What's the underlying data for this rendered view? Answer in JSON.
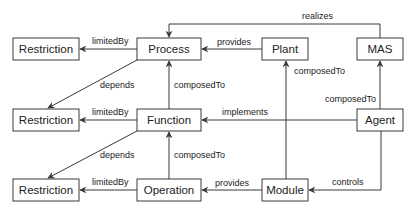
{
  "diagram": {
    "type": "ontology-relationship-graph",
    "nodes": {
      "restriction1": {
        "label": "Restriction",
        "x": 13,
        "y": 38,
        "w": 66,
        "h": 22
      },
      "process": {
        "label": "Process",
        "x": 137,
        "y": 38,
        "w": 64,
        "h": 22
      },
      "plant": {
        "label": "Plant",
        "x": 262,
        "y": 38,
        "w": 46,
        "h": 22
      },
      "mas": {
        "label": "MAS",
        "x": 357,
        "y": 38,
        "w": 46,
        "h": 22
      },
      "restriction2": {
        "label": "Restriction",
        "x": 13,
        "y": 109,
        "w": 66,
        "h": 22
      },
      "function": {
        "label": "Function",
        "x": 137,
        "y": 109,
        "w": 64,
        "h": 22
      },
      "agent": {
        "label": "Agent",
        "x": 357,
        "y": 109,
        "w": 46,
        "h": 22
      },
      "restriction3": {
        "label": "Restriction",
        "x": 13,
        "y": 179,
        "w": 66,
        "h": 22
      },
      "operation": {
        "label": "Operation",
        "x": 137,
        "y": 179,
        "w": 64,
        "h": 22
      },
      "module": {
        "label": "Module",
        "x": 262,
        "y": 179,
        "w": 46,
        "h": 22
      }
    },
    "edges": [
      {
        "from": "process",
        "to": "restriction1",
        "label": "limitedBy"
      },
      {
        "from": "plant",
        "to": "process",
        "label": "provides"
      },
      {
        "from": "mas",
        "to": "process",
        "label": "realizes"
      },
      {
        "from": "process",
        "to": "restriction2",
        "label": "depends"
      },
      {
        "from": "function",
        "to": "process",
        "label": "composedTo"
      },
      {
        "from": "module",
        "to": "plant",
        "label": "composedTo"
      },
      {
        "from": "agent",
        "to": "mas",
        "label": "composedTo"
      },
      {
        "from": "function",
        "to": "restriction2",
        "label": "limitedBy"
      },
      {
        "from": "agent",
        "to": "function",
        "label": "implements"
      },
      {
        "from": "function",
        "to": "restriction3",
        "label": "depends"
      },
      {
        "from": "operation",
        "to": "function",
        "label": "composedTo"
      },
      {
        "from": "operation",
        "to": "restriction3",
        "label": "limitedBy"
      },
      {
        "from": "module",
        "to": "operation",
        "label": "provides"
      },
      {
        "from": "agent",
        "to": "module",
        "label": "controls"
      }
    ],
    "colors": {
      "stroke": "#3a3a3a",
      "text": "#222222",
      "background": "#ffffff"
    }
  }
}
